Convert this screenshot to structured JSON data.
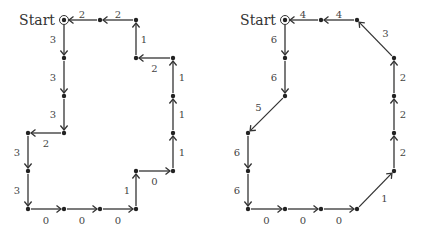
{
  "graphs": [
    {
      "name": "left",
      "start_label": "Start",
      "nodes": [
        {
          "id": "S",
          "x": 64,
          "y": 20,
          "start": true
        },
        {
          "id": "a",
          "x": 100,
          "y": 20
        },
        {
          "id": "b",
          "x": 136,
          "y": 20
        },
        {
          "id": "c",
          "x": 136,
          "y": 58
        },
        {
          "id": "d",
          "x": 173,
          "y": 58
        },
        {
          "id": "e",
          "x": 173,
          "y": 96
        },
        {
          "id": "f",
          "x": 173,
          "y": 133
        },
        {
          "id": "g",
          "x": 173,
          "y": 171
        },
        {
          "id": "h",
          "x": 136,
          "y": 171
        },
        {
          "id": "i",
          "x": 136,
          "y": 209
        },
        {
          "id": "j",
          "x": 100,
          "y": 209
        },
        {
          "id": "k",
          "x": 64,
          "y": 209
        },
        {
          "id": "l",
          "x": 28,
          "y": 209
        },
        {
          "id": "m",
          "x": 28,
          "y": 171
        },
        {
          "id": "n",
          "x": 28,
          "y": 133
        },
        {
          "id": "o",
          "x": 64,
          "y": 133
        },
        {
          "id": "p",
          "x": 64,
          "y": 96
        },
        {
          "id": "q",
          "x": 64,
          "y": 58
        }
      ],
      "edges": [
        {
          "from": "S",
          "to": "q",
          "label": "3",
          "lx": -11,
          "ly": 0
        },
        {
          "from": "q",
          "to": "p",
          "label": "3",
          "lx": -11,
          "ly": 0
        },
        {
          "from": "p",
          "to": "o",
          "label": "3",
          "lx": -11,
          "ly": 0
        },
        {
          "from": "o",
          "to": "n",
          "label": "2",
          "lx": 0,
          "ly": 10
        },
        {
          "from": "n",
          "to": "m",
          "label": "3",
          "lx": -11,
          "ly": 0
        },
        {
          "from": "m",
          "to": "l",
          "label": "3",
          "lx": -11,
          "ly": 0
        },
        {
          "from": "l",
          "to": "k",
          "label": "0",
          "lx": 0,
          "ly": 11
        },
        {
          "from": "k",
          "to": "j",
          "label": "0",
          "lx": 0,
          "ly": 11
        },
        {
          "from": "j",
          "to": "i",
          "label": "0",
          "lx": 0,
          "ly": 11
        },
        {
          "from": "i",
          "to": "h",
          "label": "1",
          "lx": -9,
          "ly": 0
        },
        {
          "from": "h",
          "to": "g",
          "label": "0",
          "lx": 0,
          "ly": 10
        },
        {
          "from": "g",
          "to": "f",
          "label": "1",
          "lx": 9,
          "ly": 0
        },
        {
          "from": "f",
          "to": "e",
          "label": "1",
          "lx": 9,
          "ly": 0
        },
        {
          "from": "e",
          "to": "d",
          "label": "1",
          "lx": 9,
          "ly": 0
        },
        {
          "from": "d",
          "to": "c",
          "label": "2",
          "lx": 0,
          "ly": 10
        },
        {
          "from": "c",
          "to": "b",
          "label": "1",
          "lx": 8,
          "ly": 0
        },
        {
          "from": "b",
          "to": "a",
          "label": "2",
          "lx": 0,
          "ly": -6
        },
        {
          "from": "a",
          "to": "S",
          "label": "2",
          "lx": 0,
          "ly": -6
        }
      ]
    },
    {
      "name": "right",
      "start_label": "Start",
      "nodes": [
        {
          "id": "S",
          "x": 285,
          "y": 20,
          "start": true
        },
        {
          "id": "a",
          "x": 321,
          "y": 20
        },
        {
          "id": "b",
          "x": 357,
          "y": 20
        },
        {
          "id": "c",
          "x": 394,
          "y": 58
        },
        {
          "id": "d",
          "x": 394,
          "y": 96
        },
        {
          "id": "e",
          "x": 394,
          "y": 133
        },
        {
          "id": "f",
          "x": 394,
          "y": 171
        },
        {
          "id": "g",
          "x": 357,
          "y": 209
        },
        {
          "id": "h",
          "x": 321,
          "y": 209
        },
        {
          "id": "i",
          "x": 285,
          "y": 209
        },
        {
          "id": "j",
          "x": 248,
          "y": 209
        },
        {
          "id": "k",
          "x": 248,
          "y": 171
        },
        {
          "id": "l",
          "x": 248,
          "y": 133
        },
        {
          "id": "m",
          "x": 285,
          "y": 96
        },
        {
          "id": "n",
          "x": 285,
          "y": 58
        }
      ],
      "edges": [
        {
          "from": "S",
          "to": "n",
          "label": "6",
          "lx": -11,
          "ly": 0
        },
        {
          "from": "n",
          "to": "m",
          "label": "6",
          "lx": -11,
          "ly": 0
        },
        {
          "from": "m",
          "to": "l",
          "label": "5",
          "lx": -8,
          "ly": -7
        },
        {
          "from": "l",
          "to": "k",
          "label": "6",
          "lx": -11,
          "ly": 0
        },
        {
          "from": "k",
          "to": "j",
          "label": "6",
          "lx": -11,
          "ly": 0
        },
        {
          "from": "j",
          "to": "i",
          "label": "0",
          "lx": 0,
          "ly": 11
        },
        {
          "from": "i",
          "to": "h",
          "label": "0",
          "lx": 0,
          "ly": 11
        },
        {
          "from": "h",
          "to": "g",
          "label": "0",
          "lx": 0,
          "ly": 11
        },
        {
          "from": "g",
          "to": "f",
          "label": "1",
          "lx": 9,
          "ly": 8
        },
        {
          "from": "f",
          "to": "e",
          "label": "2",
          "lx": 9,
          "ly": 0
        },
        {
          "from": "e",
          "to": "d",
          "label": "2",
          "lx": 9,
          "ly": 0
        },
        {
          "from": "d",
          "to": "c",
          "label": "2",
          "lx": 9,
          "ly": 0
        },
        {
          "from": "c",
          "to": "b",
          "label": "3",
          "lx": 10,
          "ly": -6
        },
        {
          "from": "b",
          "to": "a",
          "label": "4",
          "lx": 0,
          "ly": -6
        },
        {
          "from": "a",
          "to": "S",
          "label": "4",
          "lx": 0,
          "ly": -6
        }
      ]
    }
  ]
}
